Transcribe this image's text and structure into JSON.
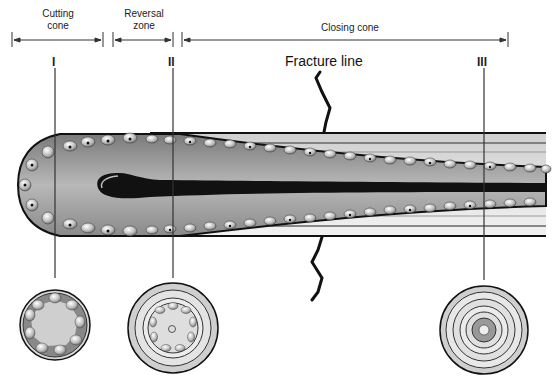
{
  "diagram": {
    "type": "bone remodeling unit (osteon) longitudinal section",
    "zones": [
      {
        "label_line1": "Cutting",
        "label_line2": "cone"
      },
      {
        "label_line1": "Reversal",
        "label_line2": "zone"
      },
      {
        "label_line1": "Closing cone",
        "label_line2": ""
      }
    ],
    "section_markers": [
      "I",
      "II",
      "III"
    ],
    "fracture_label": "Fracture line",
    "cross_sections": [
      {
        "marker": "I",
        "description": "osteoclast-lined resorption cavity"
      },
      {
        "marker": "II",
        "description": "osteoblasts with vessel, early lamellae"
      },
      {
        "marker": "III",
        "description": "concentric lamellae, narrow canal"
      }
    ]
  }
}
